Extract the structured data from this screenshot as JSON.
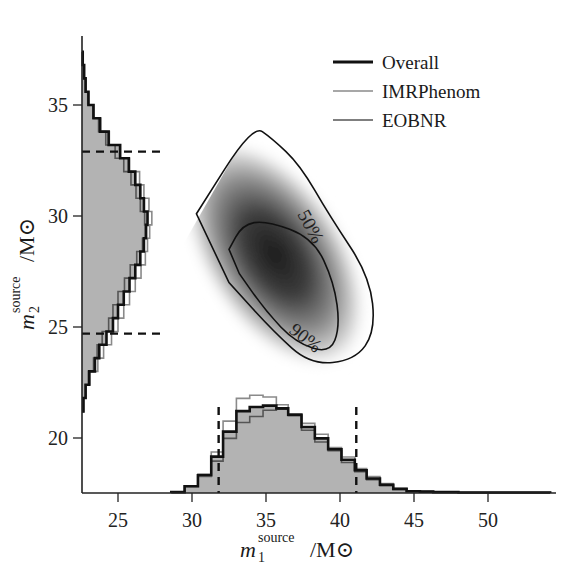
{
  "chart_data": {
    "type": "scatter",
    "subtype": "corner-plot-2d-density-with-marginal-histograms",
    "xlabel": {
      "symbol": "m",
      "subscript": "1",
      "superscript": "source",
      "unit": "/M⊙"
    },
    "ylabel": {
      "symbol": "m",
      "subscript": "2",
      "superscript": "source",
      "unit": "/M⊙"
    },
    "xlim": [
      22.6,
      54.4
    ],
    "ylim": [
      17.4,
      37.2
    ],
    "x_ticks": [
      25,
      30,
      35,
      40,
      45,
      50
    ],
    "y_ticks": [
      20,
      25,
      30,
      35
    ],
    "grid": false,
    "legend": {
      "position": "upper right",
      "entries": [
        {
          "label": "Overall",
          "color": "#111111",
          "width": 3
        },
        {
          "label": "IMRPhenom",
          "color": "#8a8a8a",
          "width": 1.5
        },
        {
          "label": "EOBNR",
          "color": "#555555",
          "width": 1.5
        }
      ]
    },
    "contours": [
      {
        "label": "50%",
        "points_m1_m2": [
          [
            32.5,
            28.5
          ],
          [
            33.4,
            29.6
          ],
          [
            35.0,
            29.8
          ],
          [
            38.2,
            29.0
          ],
          [
            39.6,
            27.0
          ],
          [
            40.0,
            25.0
          ],
          [
            39.3,
            23.8
          ],
          [
            37.0,
            24.3
          ],
          [
            35.0,
            25.7
          ],
          [
            33.2,
            27.4
          ]
        ]
      },
      {
        "label": "90%",
        "points_m1_m2": [
          [
            30.3,
            30.1
          ],
          [
            34.1,
            34.1
          ],
          [
            35.4,
            33.5
          ],
          [
            37.3,
            32.3
          ],
          [
            39.3,
            30.0
          ],
          [
            42.0,
            27.3
          ],
          [
            42.4,
            24.8
          ],
          [
            41.0,
            23.5
          ],
          [
            38.0,
            23.3
          ],
          [
            35.5,
            24.8
          ],
          [
            32.5,
            27.0
          ]
        ]
      }
    ],
    "density_peak_m1_m2": [
      36.0,
      28.0
    ],
    "m1_histogram": {
      "bin_edges": [
        28.6,
        29.5,
        30.4,
        31.3,
        32.1,
        33.0,
        33.9,
        34.8,
        35.7,
        36.5,
        37.4,
        38.3,
        39.2,
        40.1,
        41.0,
        41.8,
        42.7,
        43.6,
        44.5,
        45.4,
        46.3,
        47.1,
        48.0,
        48.9,
        49.8,
        50.7,
        51.6,
        52.5,
        53.4,
        54.2
      ],
      "overall": [
        0.2,
        1.5,
        3.9,
        8.0,
        13.5,
        18.0,
        18.9,
        19.2,
        18.6,
        17.2,
        14.5,
        12.0,
        9.6,
        7.3,
        5.0,
        3.2,
        1.8,
        0.9,
        0.4,
        0.3,
        0.2,
        0.2,
        0.1,
        0.1,
        0.1,
        0.1,
        0.1,
        0.1,
        0.1
      ],
      "IMRPhenom": [
        0.2,
        1.4,
        3.6,
        9.0,
        15.8,
        20.8,
        21.5,
        21.1,
        19.4,
        17.4,
        15.3,
        12.9,
        10.0,
        7.9,
        5.4,
        3.6,
        2.1,
        1.0,
        0.5,
        0.3,
        0.2,
        0.2,
        0.1,
        0.1,
        0.1,
        0.1,
        0.1,
        0.1,
        0.1
      ],
      "EOBNR": [
        0.2,
        1.6,
        4.1,
        7.0,
        12.0,
        15.5,
        16.8,
        18.2,
        18.4,
        17.0,
        13.8,
        11.2,
        9.3,
        6.7,
        4.7,
        2.9,
        1.6,
        0.8,
        0.4,
        0.3,
        0.2,
        0.2,
        0.1,
        0.1,
        0.1,
        0.1,
        0.1,
        0.1,
        0.1
      ],
      "credible_interval_90": [
        31.8,
        41.1
      ]
    },
    "m2_histogram": {
      "bin_edges": [
        21.2,
        21.8,
        22.4,
        23.0,
        23.6,
        24.2,
        24.8,
        25.4,
        26.0,
        26.6,
        27.2,
        27.8,
        28.4,
        29.0,
        29.6,
        30.2,
        30.8,
        31.4,
        32.0,
        32.6,
        33.2,
        33.8,
        34.4,
        35.0,
        35.6,
        36.2,
        36.8,
        37.4
      ],
      "overall": [
        0.2,
        0.5,
        1.0,
        1.8,
        2.4,
        3.4,
        4.3,
        5.0,
        5.8,
        6.6,
        7.4,
        8.1,
        8.6,
        8.9,
        9.1,
        8.6,
        8.1,
        7.4,
        6.5,
        5.3,
        3.7,
        2.5,
        1.6,
        0.9,
        0.5,
        0.3,
        0.1
      ],
      "IMRPhenom": [
        0.2,
        0.5,
        1.1,
        2.2,
        3.0,
        4.1,
        5.0,
        5.8,
        6.6,
        7.4,
        8.2,
        8.8,
        9.1,
        9.4,
        9.7,
        9.3,
        8.6,
        8.0,
        6.6,
        5.2,
        3.8,
        2.6,
        1.6,
        0.9,
        0.5,
        0.3,
        0.1
      ],
      "EOBNR": [
        0.2,
        0.5,
        0.9,
        1.6,
        2.1,
        2.8,
        3.7,
        4.3,
        5.0,
        5.9,
        6.7,
        7.6,
        8.4,
        8.8,
        8.7,
        8.1,
        7.5,
        6.8,
        5.8,
        4.6,
        3.3,
        2.3,
        1.5,
        0.8,
        0.5,
        0.3,
        0.1
      ],
      "credible_interval_90": [
        24.7,
        32.9
      ]
    },
    "contour_labels": [
      "50%",
      "90%"
    ]
  }
}
